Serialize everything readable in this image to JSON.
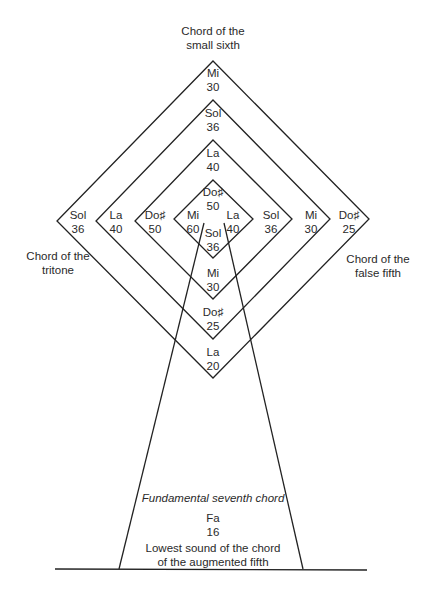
{
  "diagram": {
    "captions": {
      "top": [
        "Chord of the",
        "small sixth"
      ],
      "left": [
        "Chord of the",
        "tritone"
      ],
      "right": [
        "Chord of the",
        "false fifth"
      ],
      "base_title": "Fundamental seventh chord",
      "base_note": "Fa",
      "base_value": "16",
      "base_desc": [
        "Lowest sound of the chord",
        "of the augmented fifth"
      ]
    },
    "top_column": [
      {
        "note": "Mi",
        "value": "30"
      },
      {
        "note": "Sol",
        "value": "36"
      },
      {
        "note": "La",
        "value": "40"
      },
      {
        "note": "Do♯",
        "value": "50"
      }
    ],
    "left_row": [
      {
        "note": "Sol",
        "value": "36"
      },
      {
        "note": "La",
        "value": "40"
      },
      {
        "note": "Do♯",
        "value": "50"
      },
      {
        "note": "Mi",
        "value": "60"
      }
    ],
    "right_row": [
      {
        "note": "La",
        "value": "40"
      },
      {
        "note": "Sol",
        "value": "36"
      },
      {
        "note": "Mi",
        "value": "30"
      },
      {
        "note": "Do♯",
        "value": "25"
      }
    ],
    "bottom_column": [
      {
        "note": "Sol",
        "value": "36"
      },
      {
        "note": "Mi",
        "value": "30"
      },
      {
        "note": "Do♯",
        "value": "25"
      },
      {
        "note": "La",
        "value": "20"
      }
    ]
  }
}
